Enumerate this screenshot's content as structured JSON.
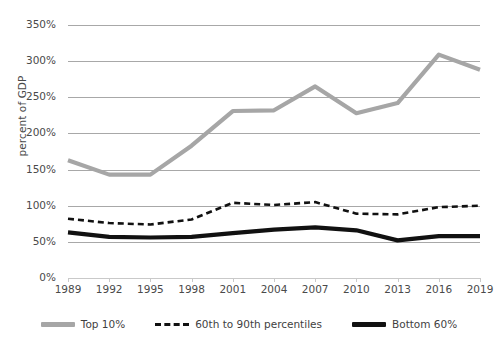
{
  "chart_data": {
    "type": "line",
    "title": "",
    "xlabel": "",
    "ylabel": "percent of GDP",
    "ylim": [
      0,
      350
    ],
    "xlim": [
      1989,
      2019
    ],
    "grid": true,
    "legend_position": "bottom",
    "y_ticks": [
      "0%",
      "50%",
      "100%",
      "150%",
      "200%",
      "250%",
      "300%",
      "350%"
    ],
    "y_tick_values": [
      0,
      50,
      100,
      150,
      200,
      250,
      300,
      350
    ],
    "x_tick_labels": [
      "1989",
      "1992",
      "1995",
      "1998",
      "2001",
      "2004",
      "2007",
      "2010",
      "2013",
      "2016",
      "2019"
    ],
    "x": [
      1989,
      1992,
      1995,
      1998,
      2001,
      2004,
      2007,
      2010,
      2013,
      2016,
      2019
    ],
    "series": [
      {
        "name": "Top 10%",
        "color": "#a6a6a6",
        "style": "solid",
        "values": [
          163,
          143,
          143,
          183,
          231,
          232,
          265,
          228,
          242,
          309,
          288
        ]
      },
      {
        "name": "60th to 90th percentiles",
        "color": "#111111",
        "style": "dashed",
        "values": [
          82,
          76,
          74,
          81,
          104,
          101,
          105,
          89,
          88,
          98,
          100
        ]
      },
      {
        "name": "Bottom 60%",
        "color": "#111111",
        "style": "solid",
        "values": [
          63,
          57,
          56,
          57,
          62,
          67,
          70,
          66,
          52,
          58,
          58
        ]
      }
    ]
  },
  "legend": {
    "items": [
      {
        "label": "Top 10%"
      },
      {
        "label": "60th to 90th percentiles"
      },
      {
        "label": "Bottom 60%"
      }
    ]
  }
}
